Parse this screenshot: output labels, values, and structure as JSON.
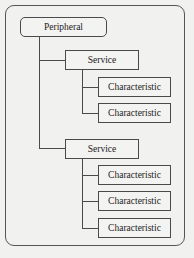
{
  "diagram": {
    "root": {
      "label": "Peripheral"
    },
    "services": [
      {
        "label": "Service",
        "characteristics": [
          {
            "label": "Characteristic"
          },
          {
            "label": "Characteristic"
          }
        ]
      },
      {
        "label": "Service",
        "characteristics": [
          {
            "label": "Characteristic"
          },
          {
            "label": "Characteristic"
          },
          {
            "label": "Characteristic"
          }
        ]
      }
    ]
  },
  "colors": {
    "background": "#f1f1ef",
    "stroke": "#4a4a4a",
    "text": "#222222"
  }
}
